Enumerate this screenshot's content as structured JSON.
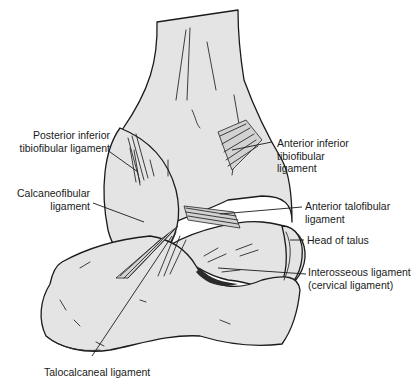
{
  "figure": {
    "colors": {
      "bone_fill": "#e4e4e4",
      "outline": "#1b1b1b",
      "label_text": "#1a1a1a",
      "background": "#ffffff"
    },
    "labels": {
      "posterior_inferior_tibiofibular": {
        "line1": "Posterior inferior",
        "line2": "tibiofibular ligament"
      },
      "calcaneofibular": {
        "line1": "Calcaneofibular",
        "line2": "ligament"
      },
      "anterior_inferior_tibiofibular": {
        "line1": "Anterior inferior",
        "line2": "tibiofibular",
        "line3": "ligament"
      },
      "anterior_talofibular": {
        "line1": "Anterior talofibular",
        "line2": "ligament"
      },
      "head_of_talus": {
        "line1": "Head of talus"
      },
      "interosseous": {
        "line1": "Interosseous ligament",
        "line2": "(cervical ligament)"
      },
      "talocalcaneal": {
        "line1": "Talocalcaneal ligament"
      }
    }
  }
}
